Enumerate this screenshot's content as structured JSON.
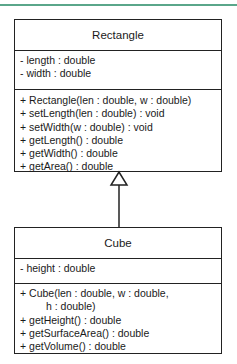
{
  "diagram": {
    "accent_line_color": "#5aa68a",
    "classes": [
      {
        "name": "Rectangle",
        "attributes": [
          "- length : double",
          "- width : double"
        ],
        "operations": [
          "+ Rectangle(len : double, w : double)",
          "+ setLength(len : double) : void",
          "+ setWidth(w : double) : void",
          "+ getLength() : double",
          "+ getWidth() : double",
          "+ getArea() : double"
        ]
      },
      {
        "name": "Cube",
        "attributes": [
          "- height : double"
        ],
        "operations": [
          "+ Cube(len : double, w : double,",
          "h : double)",
          "+ getHeight() : double",
          "+ getSurfaceArea() : double",
          "+ getVolume() : double"
        ]
      }
    ],
    "relationships": [
      {
        "type": "generalization",
        "from": "Cube",
        "to": "Rectangle"
      }
    ]
  }
}
